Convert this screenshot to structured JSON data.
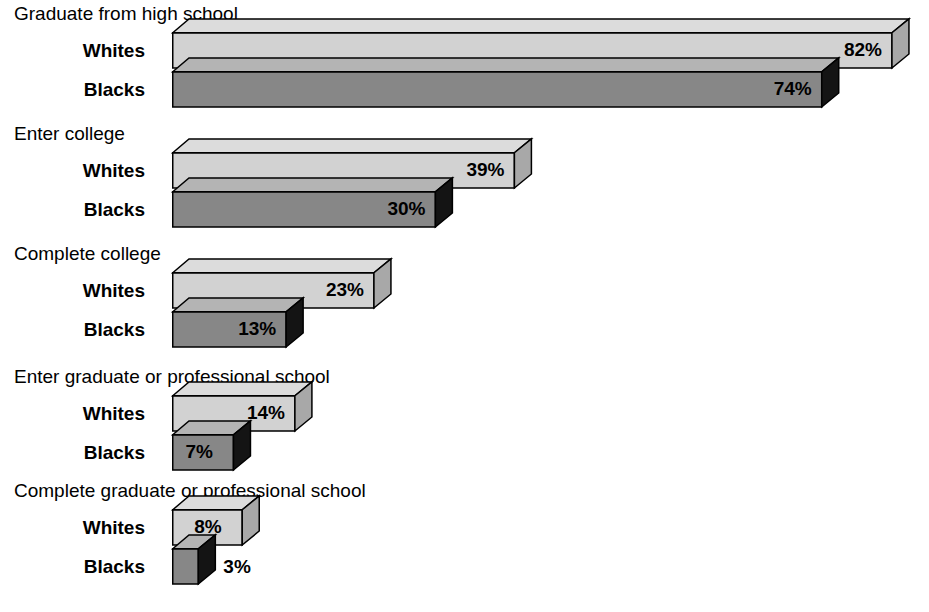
{
  "chart_data": {
    "type": "bar",
    "orientation": "horizontal",
    "title": "",
    "xlabel": "",
    "ylabel": "",
    "unit": "%",
    "xlim": [
      0,
      100
    ],
    "grid": false,
    "legend_position": "none",
    "categories": [
      "Graduate from high school",
      "Enter college",
      "Complete college",
      "Enter graduate or professional school",
      "Complete graduate or professional school"
    ],
    "series": [
      {
        "name": "Whites",
        "values": [
          82,
          39,
          23,
          14,
          8
        ]
      },
      {
        "name": "Blacks",
        "values": [
          74,
          30,
          13,
          7,
          3
        ]
      }
    ],
    "data_labels": [
      {
        "category": "Graduate from high school",
        "Whites": "82%",
        "Blacks": "74%"
      },
      {
        "category": "Enter college",
        "Whites": "39%",
        "Blacks": "30%"
      },
      {
        "category": "Complete college",
        "Whites": "23%",
        "Blacks": "13%"
      },
      {
        "category": "Enter graduate or professional school",
        "Whites": "14%",
        "Blacks": "7%"
      },
      {
        "category": "Complete graduate or professional school",
        "Whites": "8%",
        "Blacks": "3%"
      }
    ]
  },
  "colors": {
    "whites_front": "#d2d2d2",
    "whites_top": "#dcdcdc",
    "whites_side": "#a8a8a8",
    "blacks_front": "#878787",
    "blacks_top": "#b4b4b4",
    "blacks_side": "#141414",
    "outline": "#000000",
    "background": "#ffffff",
    "text": "#000000"
  },
  "groups": [
    {
      "label": "Graduate from high school",
      "rows": [
        {
          "series": "Whites",
          "value": 82,
          "value_label": "82%"
        },
        {
          "series": "Blacks",
          "value": 74,
          "value_label": "74%"
        }
      ]
    },
    {
      "label": "Enter college",
      "rows": [
        {
          "series": "Whites",
          "value": 39,
          "value_label": "39%"
        },
        {
          "series": "Blacks",
          "value": 30,
          "value_label": "30%"
        }
      ]
    },
    {
      "label": "Complete college",
      "rows": [
        {
          "series": "Whites",
          "value": 23,
          "value_label": "23%"
        },
        {
          "series": "Blacks",
          "value": 13,
          "value_label": "13%"
        }
      ]
    },
    {
      "label": "Enter graduate or professional school",
      "rows": [
        {
          "series": "Whites",
          "value": 14,
          "value_label": "14%"
        },
        {
          "series": "Blacks",
          "value": 7,
          "value_label": "7%"
        }
      ]
    },
    {
      "label": "Complete graduate or professional school",
      "rows": [
        {
          "series": "Whites",
          "value": 8,
          "value_label": "8%"
        },
        {
          "series": "Blacks",
          "value": 3,
          "value_label": "3%"
        }
      ]
    }
  ],
  "layout": {
    "bar_origin_x": 172,
    "px_per_percent": 8.78,
    "bar_height": 36,
    "depth_x": 17,
    "depth_y": 14,
    "group_tops": [
      4,
      124,
      244,
      367,
      481
    ]
  }
}
